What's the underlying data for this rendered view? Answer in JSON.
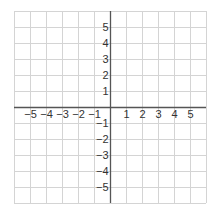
{
  "chart_data": {
    "type": "coordinate-grid",
    "title": "",
    "xlabel": "",
    "ylabel": "",
    "xlim": [
      -6,
      6
    ],
    "ylim": [
      -6,
      6
    ],
    "grid": true,
    "x_ticks": [
      -5,
      -4,
      -3,
      -2,
      -1,
      1,
      2,
      3,
      4,
      5
    ],
    "y_ticks": [
      5,
      4,
      3,
      2,
      1,
      -1,
      -2,
      -3,
      -4,
      -5
    ],
    "x_tick_labels": [
      "−5",
      "−4",
      "−3",
      "−2",
      "−1",
      "1",
      "2",
      "3",
      "4",
      "5"
    ],
    "y_tick_labels": [
      "5",
      "4",
      "3",
      "2",
      "1",
      "−1",
      "−2",
      "−3",
      "−4",
      "−5"
    ],
    "points": []
  },
  "colors": {
    "grid": "#d4d4d4",
    "axis": "#555555",
    "label": "#333333",
    "background": "#ffffff"
  }
}
